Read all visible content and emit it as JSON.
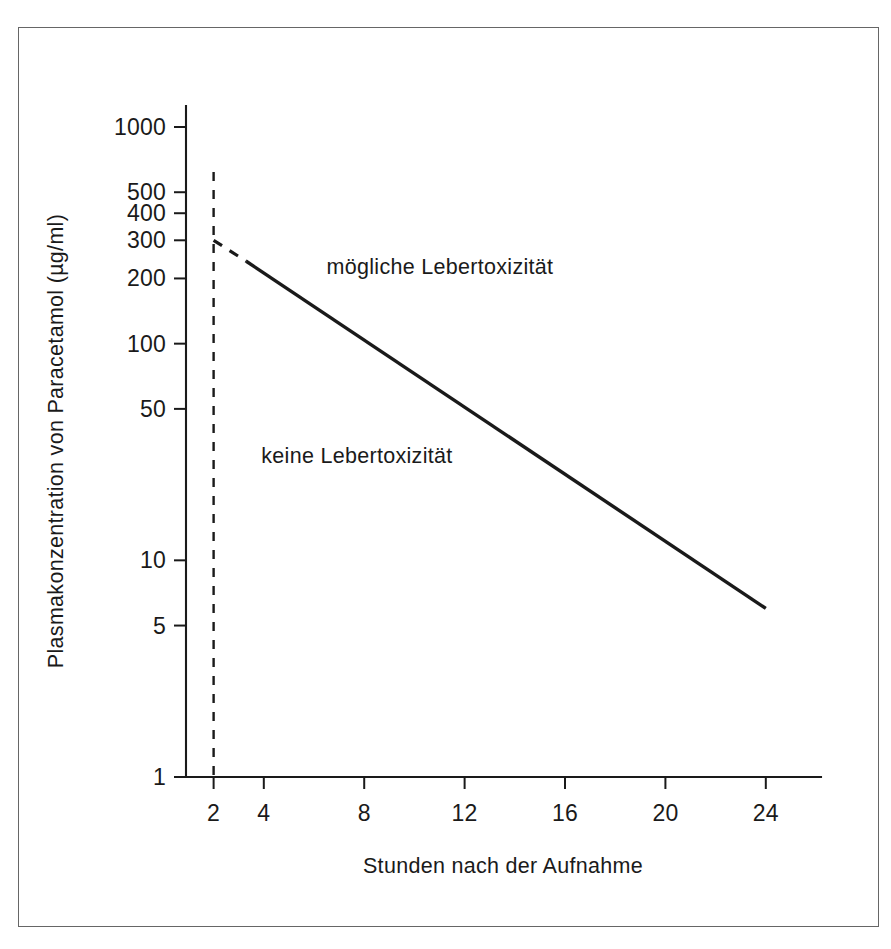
{
  "chart_data": {
    "type": "line",
    "title": "",
    "xlabel": "Stunden nach der Aufnahme",
    "ylabel": "Plasmakonzentration von Paracetamol (µg/ml)",
    "yscale": "log",
    "ylim": [
      1,
      1000
    ],
    "xlim": [
      0,
      25
    ],
    "grid": false,
    "legend": "none",
    "y_ticks": [
      {
        "value": 1000,
        "label": "1000"
      },
      {
        "value": 500,
        "label": "500"
      },
      {
        "value": 400,
        "label": "400"
      },
      {
        "value": 300,
        "label": "300"
      },
      {
        "value": 200,
        "label": "200"
      },
      {
        "value": 100,
        "label": "100"
      },
      {
        "value": 50,
        "label": "50"
      },
      {
        "value": 10,
        "label": "10"
      },
      {
        "value": 5,
        "label": "5"
      },
      {
        "value": 1,
        "label": "1"
      }
    ],
    "x_ticks": [
      {
        "value": 2,
        "label": "2"
      },
      {
        "value": 4,
        "label": "4"
      },
      {
        "value": 8,
        "label": "8"
      },
      {
        "value": 12,
        "label": "12"
      },
      {
        "value": 16,
        "label": "16"
      },
      {
        "value": 20,
        "label": "20"
      },
      {
        "value": 24,
        "label": "24"
      }
    ],
    "series": [
      {
        "name": "Behandlungslinie (gestrichelt)",
        "style": "dashed",
        "points": [
          [
            2,
            300
          ],
          [
            3.3,
            240
          ]
        ]
      },
      {
        "name": "Behandlungslinie (durchgezogen)",
        "style": "solid",
        "points": [
          [
            3.3,
            240
          ],
          [
            24,
            6
          ]
        ]
      },
      {
        "name": "Zeitmarke 4 Stunden",
        "style": "dashed-vertical",
        "points": [
          [
            2,
            620
          ],
          [
            2,
            1
          ]
        ]
      }
    ],
    "annotations": [
      {
        "text": "mögliche Lebertoxizität",
        "x": 6.5,
        "y": 210
      },
      {
        "text": "keine Lebertoxizität",
        "x": 3.9,
        "y": 28
      }
    ]
  },
  "figure": {
    "border_color": "#666666",
    "line_color": "#1a1a1a",
    "background": "#ffffff"
  }
}
